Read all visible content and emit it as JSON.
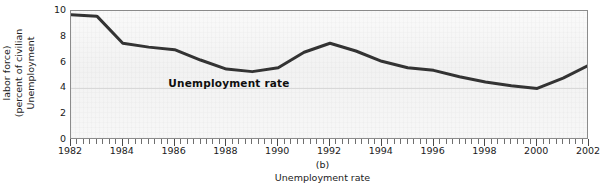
{
  "figure": {
    "panel_letter": "(b)",
    "caption": "Unemployment rate"
  },
  "chart_data": {
    "type": "line",
    "title": "",
    "subtitle": "",
    "xlabel": "",
    "ylabel": "Unemployment (percent of civilian labor force)",
    "ylabel_lines": [
      "Unemployment",
      "(percent of civilian",
      "labor force)"
    ],
    "xlim": [
      1982,
      2002
    ],
    "ylim": [
      0,
      10
    ],
    "y_ticks": [
      0,
      2,
      4,
      6,
      8,
      10
    ],
    "y_tick_labels": [
      "0",
      "2",
      "4",
      "6",
      "8",
      "10"
    ],
    "x_ticks": [
      1982,
      1984,
      1986,
      1988,
      1990,
      1992,
      1994,
      1996,
      1998,
      2000,
      2002
    ],
    "x_tick_labels": [
      "1982",
      "1984",
      "1986",
      "1988",
      "1990",
      "1992",
      "1994",
      "1996",
      "1998",
      "2000",
      "2002"
    ],
    "x_minor_tick_interval_years": 0.25,
    "grid": "horizontal-faint",
    "legend": "none",
    "annotations": [
      {
        "text": "Unemployment rate",
        "x": 1988.1,
        "y": 4.45,
        "bold": true
      }
    ],
    "series": [
      {
        "name": "Unemployment rate",
        "color": "#333333",
        "line_width": 3,
        "x": [
          1982,
          1983,
          1984,
          1985,
          1986,
          1987,
          1988,
          1989,
          1990,
          1991,
          1992,
          1993,
          1994,
          1995,
          1996,
          1997,
          1998,
          1999,
          2000,
          2001,
          2002
        ],
        "values": [
          9.7,
          9.6,
          7.5,
          7.2,
          7.0,
          6.2,
          5.5,
          5.3,
          5.6,
          6.8,
          7.5,
          6.9,
          6.1,
          5.6,
          5.4,
          4.9,
          4.5,
          4.2,
          4.0,
          4.8,
          5.8
        ]
      }
    ]
  }
}
